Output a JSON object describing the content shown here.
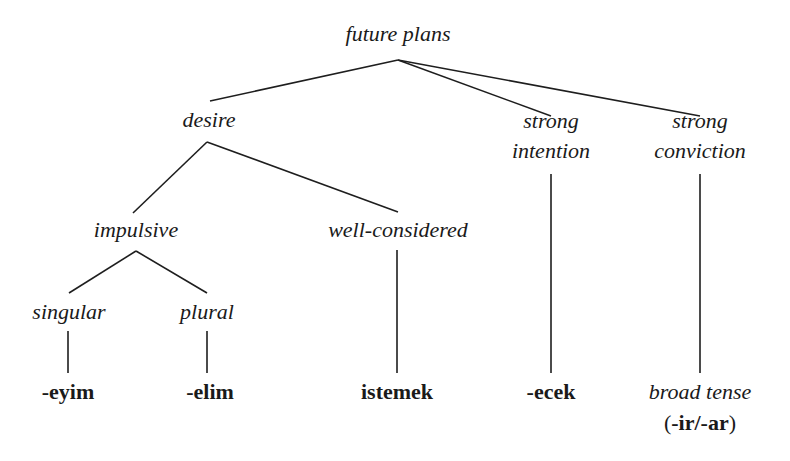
{
  "diagram": {
    "type": "tree",
    "root": {
      "id": "future_plans",
      "label": "future plans"
    },
    "nodes": {
      "future_plans": "future plans",
      "desire": "desire",
      "strong_intention_1": "strong",
      "strong_intention_2": "intention",
      "strong_conviction_1": "strong",
      "strong_conviction_2": "conviction",
      "impulsive": "impulsive",
      "well_considered": "well-considered",
      "singular": "singular",
      "plural": "plural"
    },
    "leaves": {
      "eyim": "-eyim",
      "elim": "-elim",
      "istemek": "istemek",
      "ecek": "-ecek",
      "broad_tense": "broad tense",
      "broad_tense_paren_open": "(",
      "broad_tense_suffix": "-ir/-ar",
      "broad_tense_paren_close": ")"
    },
    "edges": [
      [
        "future plans",
        "desire"
      ],
      [
        "future plans",
        "strong intention"
      ],
      [
        "future plans",
        "strong conviction"
      ],
      [
        "desire",
        "impulsive"
      ],
      [
        "desire",
        "well-considered"
      ],
      [
        "impulsive",
        "singular"
      ],
      [
        "impulsive",
        "plural"
      ],
      [
        "singular",
        "-eyim"
      ],
      [
        "plural",
        "-elim"
      ],
      [
        "well-considered",
        "istemek"
      ],
      [
        "strong intention",
        "-ecek"
      ],
      [
        "strong conviction",
        "broad tense (-ir/-ar)"
      ]
    ],
    "line_color": "#1e1e1e",
    "text_color": "#1a1a1a"
  }
}
